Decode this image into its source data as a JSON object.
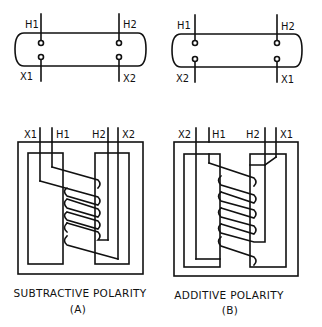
{
  "diagram_a": {
    "bushing_labels": {
      "top_left": "H1",
      "top_right": "H2",
      "bottom_left": "X1",
      "bottom_right": "X2"
    },
    "core_labels": {
      "l1": "X1",
      "l2": "H1",
      "l3": "H2",
      "l4": "X2"
    },
    "caption": "SUBTRACTIVE POLARITY",
    "sub": "(A)"
  },
  "diagram_b": {
    "bushing_labels": {
      "top_left": "H1",
      "top_right": "H2",
      "bottom_left": "X2",
      "bottom_right": "X1"
    },
    "core_labels": {
      "l1": "X2",
      "l2": "H1",
      "l3": "H2",
      "l4": "X1"
    },
    "caption": "ADDITIVE POLARITY",
    "sub": "(B)"
  }
}
